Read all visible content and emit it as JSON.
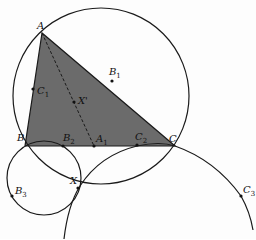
{
  "diagram": {
    "type": "geometry",
    "triangle": {
      "vertices": [
        "A",
        "B",
        "C"
      ],
      "fill": "#6b6b6b"
    },
    "points": {
      "A": {
        "label": "A",
        "sub": "",
        "x": 42,
        "y": 33
      },
      "B": {
        "label": "B",
        "sub": "",
        "x": 25,
        "y": 146
      },
      "C": {
        "label": "C",
        "sub": "",
        "x": 175,
        "y": 146
      },
      "A1": {
        "label": "A",
        "sub": "1",
        "x": 94,
        "y": 146
      },
      "B1": {
        "label": "B",
        "sub": "1",
        "x": 112,
        "y": 81
      },
      "C1": {
        "label": "C",
        "sub": "1",
        "x": 33,
        "y": 89
      },
      "B2": {
        "label": "B",
        "sub": "2",
        "x": 63,
        "y": 146
      },
      "C2": {
        "label": "C",
        "sub": "2",
        "x": 137,
        "y": 145
      },
      "B3": {
        "label": "B",
        "sub": "3",
        "x": 12,
        "y": 196
      },
      "C3": {
        "label": "C",
        "sub": "3",
        "x": 241,
        "y": 196
      },
      "X": {
        "label": "X",
        "sub": "",
        "x": 78,
        "y": 188
      },
      "Xp": {
        "label": "X'",
        "sub": "",
        "x": 74,
        "y": 102
      }
    },
    "circles": [
      {
        "name": "circumcircle",
        "cx": 101,
        "cy": 96,
        "r": 88
      },
      {
        "name": "circle-B-B2-X-B3",
        "cx": 44,
        "cy": 178,
        "r": 37
      },
      {
        "name": "arc-C2-C-C3-X"
      }
    ],
    "segments": [
      {
        "from": "A",
        "to": "A1",
        "style": "dashed"
      }
    ],
    "colors": {
      "stroke": "#1a1a1a",
      "fill": "#6b6b6b",
      "background": "#fdfdfd"
    }
  }
}
